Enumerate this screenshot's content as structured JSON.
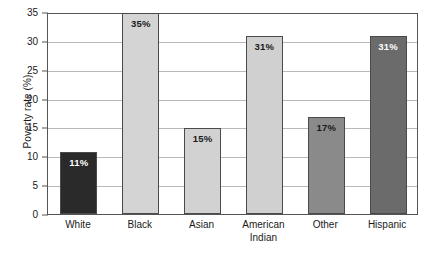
{
  "chart_data": {
    "type": "bar",
    "title": "",
    "subtitle": "",
    "xlabel": "",
    "ylabel": "Poverty rate (%)",
    "ylim": [
      0,
      35
    ],
    "ytick_step": 5,
    "grid": true,
    "legend": "none",
    "categories": [
      "White",
      "Black",
      "Asian",
      "American Indian",
      "Other",
      "Hispanic"
    ],
    "values": [
      11,
      35,
      15,
      31,
      17,
      31
    ],
    "value_labels": [
      "11%",
      "35%",
      "15%",
      "31%",
      "17%",
      "31%"
    ],
    "y_ticks": [
      "0",
      "5",
      "10",
      "15",
      "20",
      "25",
      "30",
      "35"
    ],
    "bar_colors": [
      "#2a2a2a",
      "#d4d4d4",
      "#d2d2d2",
      "#d0d0d0",
      "#8a8a8a",
      "#6b6b6b"
    ],
    "bar_label_colors": [
      "#ffffff",
      "#1a1a1a",
      "#1a1a1a",
      "#1a1a1a",
      "#1a1a1a",
      "#ffffff"
    ],
    "bar_border_color": "#4a4a4a",
    "gridline_color": "#b9b9b9",
    "axis_color": "#555555",
    "background_color": "#ffffff",
    "category_label_lines": [
      [
        "White"
      ],
      [
        "Black"
      ],
      [
        "Asian"
      ],
      [
        "American",
        "Indian"
      ],
      [
        "Other"
      ],
      [
        "Hispanic"
      ]
    ]
  }
}
